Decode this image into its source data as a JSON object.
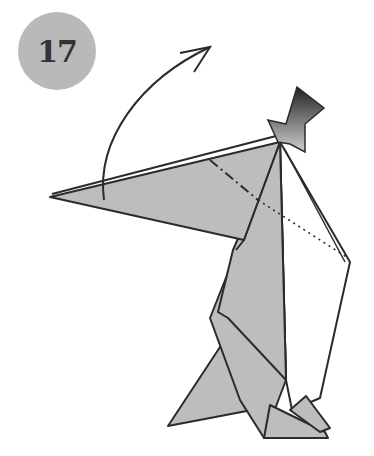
{
  "step": {
    "number": "17",
    "badge_color": "#b9b9b9",
    "text_color": "#333333"
  },
  "diagram": {
    "paper_color": "#bdbdbd",
    "line_color": "#2b2b2b",
    "instruction_symbols": [
      "valley-fold (dash-dot) line",
      "x-ray (dotted) line",
      "fold-up curved arrow",
      "push/sink arrow"
    ]
  }
}
